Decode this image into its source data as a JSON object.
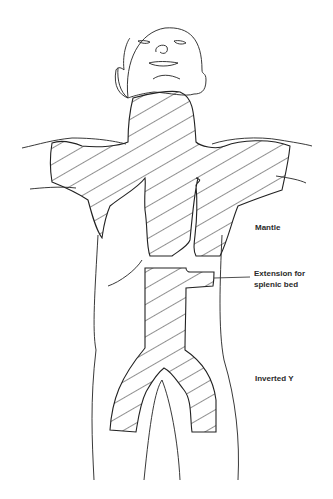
{
  "diagram": {
    "labels": {
      "mantle": "Mantle",
      "extension_line1": "Extension for",
      "extension_line2": "splenic bed",
      "inverted_y": "Inverted Y"
    },
    "colors": {
      "line": "#222222",
      "background": "#ffffff"
    }
  }
}
